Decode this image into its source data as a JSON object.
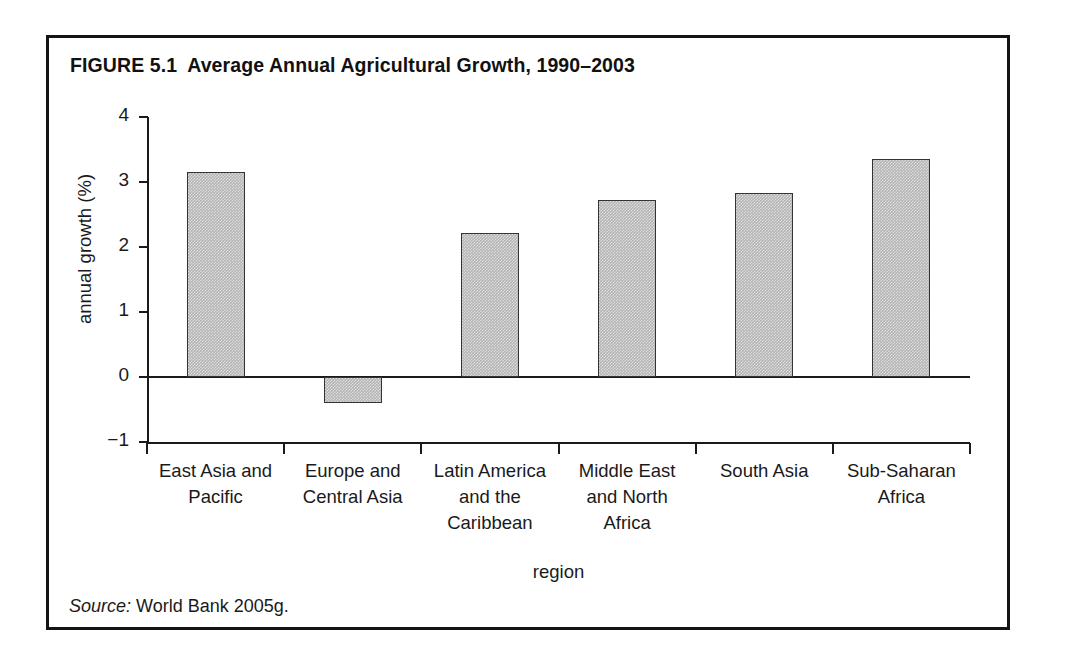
{
  "figure": {
    "number_label": "FIGURE 5.1",
    "title": "Average Annual Agricultural Growth, 1990–2003",
    "source_word": "Source:",
    "source_text": "World Bank 2005g."
  },
  "colors": {
    "frame": "#141414",
    "axis": "#1a1a1a",
    "bar_fill": "#b3b3b3",
    "bar_stroke": "#333333",
    "background": "#ffffff",
    "text": "#1a1a1a"
  },
  "chart_data": {
    "type": "bar",
    "xlabel": "region",
    "ylabel": "annual growth (%)",
    "ylim": [
      -1,
      4
    ],
    "ytick_labels": [
      "4",
      "3",
      "2",
      "1",
      "0",
      "−1"
    ],
    "ytick_values": [
      4,
      3,
      2,
      1,
      0,
      -1
    ],
    "grid": false,
    "legend": "none",
    "categories": [
      "East Asia and Pacific",
      "Europe and Central Asia",
      "Latin America and the Caribbean",
      "Middle East and North Africa",
      "South Asia",
      "Sub-Saharan Africa"
    ],
    "category_lines": [
      [
        "East Asia and",
        "Pacific"
      ],
      [
        "Europe and",
        "Central Asia"
      ],
      [
        "Latin America",
        "and the",
        "Caribbean"
      ],
      [
        "Middle East",
        "and North",
        "Africa"
      ],
      [
        "South Asia"
      ],
      [
        "Sub-Saharan",
        "Africa"
      ]
    ],
    "values": [
      3.15,
      -0.4,
      2.22,
      2.72,
      2.83,
      3.35
    ],
    "source": "World Bank 2005g."
  }
}
